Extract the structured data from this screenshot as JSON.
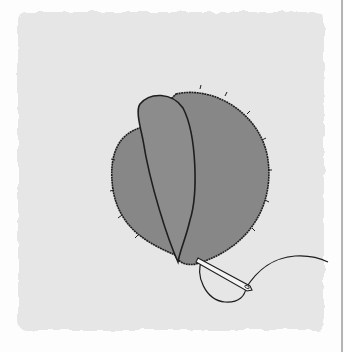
{
  "illustration": {
    "subject": "appliqué petals stitched onto fabric swatch with needle and thread",
    "colors": {
      "background": "#fdfdfd",
      "fabric": "#e6e6e6",
      "petal_fill": "#878787",
      "outline": "#1e1e1e",
      "needle": "#f4f4f4",
      "edge_line": "#b5b5b5"
    },
    "elements": [
      "fabric-swatch",
      "back-petal",
      "front-petal",
      "needle",
      "thread",
      "stitches"
    ]
  }
}
